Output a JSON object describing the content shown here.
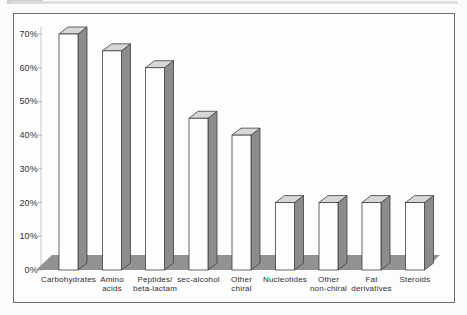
{
  "figure": {
    "background": "#fbfbfb",
    "frame_fill": "#fdfdfd",
    "frame_border_color": "#6e6e6e",
    "scan_streak_color": "#dcdcdc"
  },
  "chart_data": {
    "type": "bar",
    "effect": "3d-column",
    "title": "",
    "xlabel": "",
    "ylabel": "",
    "unit": "%",
    "grid": false,
    "legend": null,
    "ylim": [
      0,
      70
    ],
    "ytick_step": 10,
    "ytick_labels": [
      "0%",
      "10%",
      "20%",
      "30%",
      "40%",
      "50%",
      "60%",
      "70%"
    ],
    "categories": [
      "Carbohydrates",
      "Amino acids",
      "Peptides/ beta-lactam",
      "sec-alcohol",
      "Other chiral",
      "Nucleotides",
      "Other non-chiral",
      "Fat derivatives",
      "Steroids"
    ],
    "category_lines": [
      [
        "Carbohydrates"
      ],
      [
        "Amino",
        "acids"
      ],
      [
        "Peptides/",
        "beta-lactam"
      ],
      [
        "sec-alcohol"
      ],
      [
        "Other",
        "chiral"
      ],
      [
        "Nucleotides"
      ],
      [
        "Other",
        "non-chiral"
      ],
      [
        "Fat",
        "derivatives"
      ],
      [
        "Steroids"
      ]
    ],
    "values": [
      70,
      65,
      60,
      45,
      40,
      20,
      20,
      20,
      20
    ],
    "colors": {
      "bar_front": "#fdfdfd",
      "bar_side": "#8c8c8c",
      "bar_top": "#d7d7d7",
      "bar_outline": "#3f3f3f",
      "floor": "#929292",
      "axis_line": "#c9c9c9",
      "tick_mark": "#b5b5b5",
      "axis_text": "#333333",
      "category_text": "#2e2e2e"
    }
  }
}
